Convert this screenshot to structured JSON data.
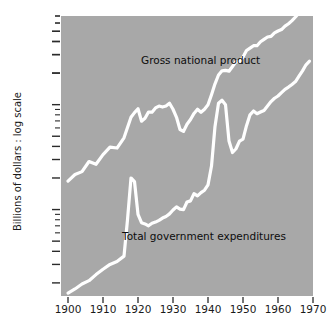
{
  "chart_data": {
    "type": "line",
    "title": "",
    "subtitle": "",
    "xlabel": "",
    "ylabel": "Billions of dollars : log scale",
    "yscale": "log",
    "ylim": [
      1.5,
      700
    ],
    "xlim": [
      1898,
      1970
    ],
    "grid": false,
    "legend_position": "inline-annotation",
    "background_color": "#a8a8a8",
    "line_color": "#ffffff",
    "text_color": "#1a1a1a",
    "yticks": [
      2,
      3,
      4,
      5,
      10,
      20,
      30,
      40,
      50,
      100,
      200,
      300,
      400,
      500
    ],
    "ytick_labels": [
      "2",
      "3",
      "4",
      "5",
      "10",
      "20",
      "30",
      "40",
      "50",
      "100",
      "200",
      "300",
      "400",
      "500"
    ],
    "xticks": [
      1900,
      1910,
      1920,
      1930,
      1940,
      1950,
      1960,
      1970
    ],
    "xtick_labels": [
      "1900",
      "1910",
      "1920",
      "1930",
      "1940",
      "1950",
      "1960",
      "1970"
    ],
    "series": [
      {
        "name": "Gross national product",
        "label_position": {
          "x": 1920,
          "y": 260
        },
        "x": [
          1900,
          1902,
          1904,
          1906,
          1908,
          1910,
          1912,
          1914,
          1916,
          1918,
          1919,
          1920,
          1921,
          1922,
          1923,
          1924,
          1925,
          1926,
          1927,
          1928,
          1929,
          1930,
          1931,
          1932,
          1933,
          1934,
          1935,
          1936,
          1937,
          1938,
          1939,
          1940,
          1941,
          1942,
          1943,
          1944,
          1945,
          1946,
          1947,
          1948,
          1949,
          1950,
          1951,
          1952,
          1953,
          1954,
          1955,
          1956,
          1957,
          1958,
          1959,
          1960,
          1961,
          1962,
          1963,
          1964,
          1965,
          1966,
          1967,
          1968,
          1969
        ],
        "values": [
          18.7,
          21.6,
          23.0,
          28.7,
          27.0,
          33.4,
          39.4,
          38.6,
          48.3,
          75.8,
          84.0,
          91.5,
          69.6,
          74.1,
          85.1,
          84.7,
          93.1,
          97.0,
          94.9,
          97.0,
          103.1,
          90.4,
          75.8,
          58.0,
          55.6,
          65.1,
          72.2,
          82.5,
          90.4,
          84.7,
          90.5,
          99.7,
          124.5,
          157.9,
          191.6,
          210.1,
          211.9,
          208.5,
          231.3,
          257.6,
          256.5,
          284.8,
          328.4,
          345.5,
          364.6,
          364.8,
          398.0,
          419.2,
          441.1,
          447.3,
          483.7,
          503.7,
          520.1,
          560.3,
          590.5,
          632.4,
          684.9,
          749.9,
          793.9,
          864.2,
          930.3
        ]
      },
      {
        "name": "Total government expenditures",
        "label_position": {
          "x": 1921,
          "y": 6.5
        },
        "x": [
          1900,
          1902,
          1904,
          1906,
          1908,
          1910,
          1912,
          1914,
          1916,
          1917,
          1918,
          1919,
          1920,
          1921,
          1922,
          1923,
          1924,
          1925,
          1926,
          1927,
          1928,
          1929,
          1930,
          1931,
          1932,
          1933,
          1934,
          1935,
          1936,
          1937,
          1938,
          1939,
          1940,
          1941,
          1942,
          1943,
          1944,
          1945,
          1946,
          1947,
          1948,
          1949,
          1950,
          1951,
          1952,
          1953,
          1954,
          1955,
          1956,
          1957,
          1958,
          1959,
          1960,
          1961,
          1962,
          1963,
          1964,
          1965,
          1966,
          1967,
          1968,
          1969
        ],
        "values": [
          1.6,
          1.75,
          1.95,
          2.1,
          2.4,
          2.7,
          3.0,
          3.2,
          3.6,
          8.0,
          20.0,
          18.5,
          9.0,
          7.5,
          7.3,
          7.0,
          7.4,
          7.6,
          7.9,
          8.3,
          8.6,
          9.1,
          9.9,
          10.6,
          10.1,
          10.0,
          11.8,
          12.1,
          14.2,
          13.5,
          14.5,
          15.3,
          17.2,
          26.0,
          62.0,
          103.0,
          110.0,
          100.0,
          45.0,
          35.0,
          38.0,
          45.0,
          47.0,
          63.0,
          80.0,
          87.0,
          82.0,
          85.0,
          88.0,
          97.0,
          107.0,
          115.0,
          121.0,
          130.0,
          140.0,
          147.0,
          156.0,
          166.0,
          187.0,
          210.0,
          240.0,
          260.0
        ]
      }
    ]
  },
  "axis": {
    "ylabel": "Billions of dollars : log scale"
  },
  "labels": {
    "gnp": "Gross national product",
    "gov": "Total government expenditures"
  }
}
